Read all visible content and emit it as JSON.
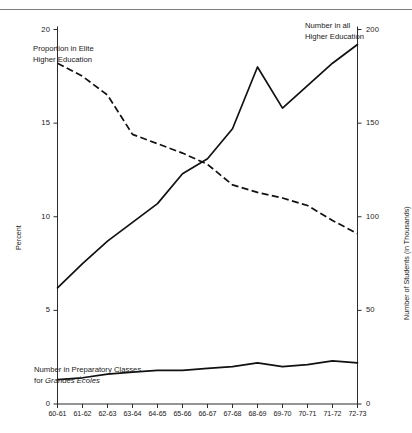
{
  "chart_data": {
    "type": "line",
    "title": "",
    "subtitle": "",
    "categories": [
      "60-61",
      "61-62",
      "62-63",
      "63-64",
      "64-65",
      "65-66",
      "66-67",
      "67-68",
      "68-69",
      "69-70",
      "70-71",
      "71-72",
      "72-73"
    ],
    "xlabel": "",
    "ylabel": "Percent",
    "ylabel_right": "Number of Students (in Thousands)",
    "ylim": [
      0,
      20
    ],
    "ylim_right": [
      0,
      200
    ],
    "yticks": [
      0,
      5,
      10,
      15,
      20
    ],
    "yticks_right": [
      0,
      50,
      100,
      150,
      200
    ],
    "grid": false,
    "legend_position": "inline-annotations",
    "series": [
      {
        "name": "Proportion in Elite Higher Education",
        "axis": "left",
        "unit": "percent",
        "style": "dashed",
        "values": [
          18.2,
          17.5,
          16.5,
          14.4,
          13.9,
          13.4,
          12.8,
          11.7,
          11.3,
          11.0,
          10.6,
          9.8,
          9.1
        ]
      },
      {
        "name": "Number in all Higher Education",
        "axis": "right",
        "unit": "thousands",
        "style": "solid",
        "values": [
          62,
          75,
          87,
          97,
          107,
          123,
          131,
          147,
          180,
          158,
          170,
          182,
          192
        ]
      },
      {
        "name": "Number in Preparatory Classes for Grandes Écoles",
        "axis": "right",
        "unit": "thousands",
        "style": "solid",
        "values": [
          13,
          14,
          16,
          17,
          18,
          18,
          19,
          20,
          22,
          20,
          21,
          23,
          22
        ]
      }
    ],
    "annotations": [
      {
        "id": "elite",
        "line1": "Proportion in Elite",
        "line2": "Higher Education"
      },
      {
        "id": "all-he",
        "line1": "Number in all",
        "line2": "Higher Education"
      },
      {
        "id": "prep",
        "line1": "Number in Preparatory Classes",
        "line2_prefix": "for ",
        "line2_italic": "Grandes Écoles"
      }
    ]
  },
  "axes": {
    "left": {
      "title": "Percent",
      "tick_labels": [
        "0",
        "5",
        "10",
        "15",
        "20"
      ]
    },
    "right": {
      "title": "Number of Students (in Thousands)",
      "tick_labels": [
        "0",
        "50",
        "100",
        "150",
        "200"
      ]
    },
    "bottom": {
      "tick_labels": [
        "60-61",
        "61-62",
        "62-63",
        "63-64",
        "64-65",
        "65-66",
        "66-67",
        "67-68",
        "68-69",
        "69-70",
        "70-71",
        "71-72",
        "72-73"
      ]
    }
  },
  "colors": {
    "ink": "#111111",
    "axis": "#2b2b2b",
    "rule": "#7d7d7d",
    "background": "#ffffff"
  }
}
